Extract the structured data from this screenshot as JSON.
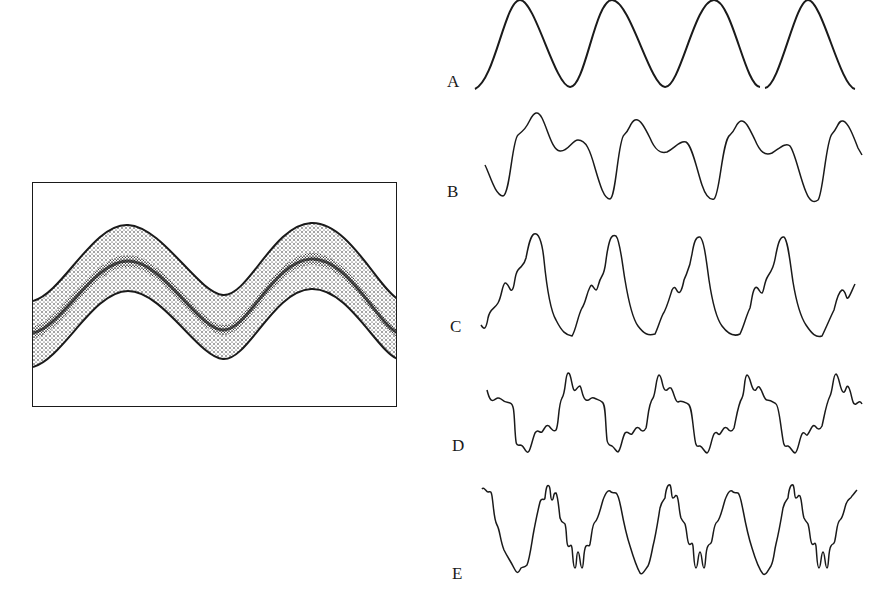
{
  "figure": {
    "left_panel": {
      "description": "Oscilloscope-style display of a noisy sine wave band",
      "cycles_visible": 2
    },
    "waveforms": [
      {
        "label": "A",
        "description": "pure sine wave",
        "cycles": 4
      },
      {
        "label": "B",
        "description": "sine with second harmonic",
        "cycles": 4
      },
      {
        "label": "C",
        "description": "sine with multiple low harmonics",
        "cycles": 4
      },
      {
        "label": "D",
        "description": "complex waveform with higher harmonics",
        "cycles": 4
      },
      {
        "label": "E",
        "description": "complex waveform with many high harmonics",
        "cycles": 4
      }
    ]
  },
  "colors": {
    "ink": "#1a1a1a",
    "background": "#ffffff"
  }
}
